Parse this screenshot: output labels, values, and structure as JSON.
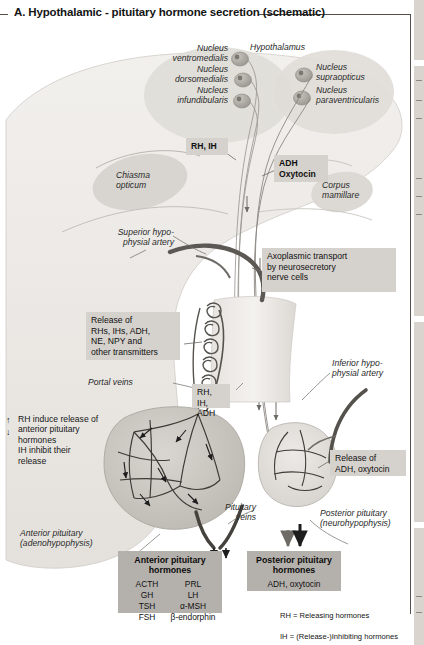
{
  "panel": {
    "letter": "A.",
    "title": "A.  Hypothalamic - pituitary hormone secretion (schematic)"
  },
  "anatomy_labels": {
    "hypothalamus": "Hypothalamus",
    "nucleus_ventromedialis": "Nucleus\nventromedialis",
    "nucleus_dorsomedialis": "Nucleus\ndorsomedialis",
    "nucleus_infundibularis": "Nucleus\ninfundibularis",
    "nucleus_supraopticus": "Nucleus\nsupraopticus",
    "nucleus_paraventricularis": "Nucleus\nparaventricularis",
    "chiasma_opticum": "Chiasma\nopticum",
    "corpus_mamillare": "Corpus\nmamillare",
    "superior_hypophysial_artery": "Superior hypo-\nphysial artery",
    "inferior_hypophysial_artery": "Inferior hypo-\nphysial artery",
    "portal_veins": "Portal veins",
    "pituitary_veins": "Pituitary\nveins",
    "anterior_pituitary": "Anterior pituitary\n(adenohypophysis)",
    "posterior_pituitary": "Posterior pituitary\n(neurohypophysis)"
  },
  "callouts": {
    "rh_ih": "RH, IH",
    "adh_oxytocin": "ADH\nOxytocin",
    "axoplasmic_transport": "Axoplasmic transport\nby neurosecretory\nnerve cells",
    "release_of_rhs": "Release of\nRHs, IHs, ADH,\nNE, NPY and\nother transmitters",
    "rh_ih_adh": "RH, IH,\nADH",
    "release_adh_oxytocin": "Release of\nADH, oxytocin"
  },
  "notes": {
    "rh_induce": "RH induce release of\nanterior pituitary\nhormones\nIH inhibit their\nrelease",
    "arrow_up": "↑",
    "arrow_down": "↓"
  },
  "anterior_panel": {
    "title": "Anterior pituitary\nhormones",
    "hormones_left": [
      "ACTH",
      "GH",
      "TSH",
      "FSH"
    ],
    "hormones_right": [
      "PRL",
      "LH",
      "α-MSH",
      "β-endorphin"
    ]
  },
  "posterior_panel": {
    "title": "Posterior pituitary\nhormones",
    "hormones": "ADH, oxytocin"
  },
  "legend": {
    "line1": "RH = Releasing hormones",
    "line2": "IH  = (Release-)Inhibiting hormones"
  },
  "colors": {
    "box_fill": "#d5d1cc",
    "panel_fill": "#b4b0ab",
    "vessel_dark": "#5c5954",
    "vessel_mid": "#8e8a85",
    "tissue_light": "#e9e7e3",
    "tissue_mid": "#dddad5",
    "ink": "#1b1b1b"
  }
}
